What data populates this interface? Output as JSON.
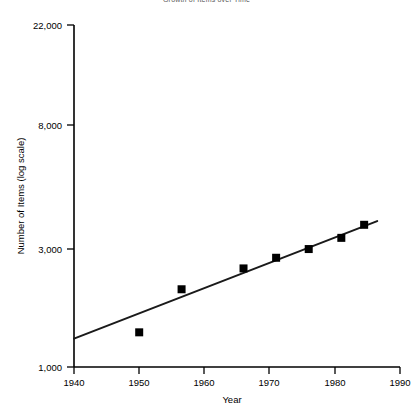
{
  "chart_data": {
    "type": "scatter",
    "title": "Growth of Items over Time",
    "title_truncated": true,
    "xlabel": "Year",
    "ylabel": "Number of Items (log scale)",
    "yscale": "log",
    "xlim": [
      1940,
      1990
    ],
    "ylim": [
      1000,
      22000
    ],
    "grid": false,
    "legend": false,
    "xticks": [
      1940,
      1950,
      1960,
      1970,
      1980,
      1990
    ],
    "xtick_labels": [
      "1940",
      "1950",
      "1960",
      "1970",
      "1980",
      "1990"
    ],
    "yticks": [
      1000,
      3000,
      8000,
      22000
    ],
    "ytick_labels": [
      "1,000",
      "3,000",
      "8,000",
      "22,000"
    ],
    "series": [
      {
        "name": "Number of Items",
        "marker": "square",
        "color": "#000000",
        "x": [
          1950,
          1956.5,
          1966,
          1971,
          1976,
          1981,
          1984.5
        ],
        "y": [
          2050,
          5000,
          7700,
          9600,
          11500,
          14500,
          19000
        ]
      },
      {
        "name": "Fitted trend line",
        "type": "line",
        "color": "#1a1a1a",
        "x": [
          1940,
          1986.5
        ],
        "y": [
          1800,
          20500
        ]
      }
    ]
  },
  "axes": {
    "y_title": "Number of Items (log scale)",
    "x_title": "Year",
    "y_ticks": [
      {
        "label": "22,000",
        "value": 22000
      },
      {
        "label": "8,000",
        "value": 8000
      },
      {
        "label": "3,000",
        "value": 3000
      },
      {
        "label": "1,000",
        "value": 1000
      }
    ],
    "x_ticks": [
      {
        "label": "1940",
        "value": 1940
      },
      {
        "label": "1950",
        "value": 1950
      },
      {
        "label": "1960",
        "value": 1960
      },
      {
        "label": "1970",
        "value": 1970
      },
      {
        "label": "1980",
        "value": 1980
      },
      {
        "label": "1990",
        "value": 1990
      }
    ]
  },
  "header": {
    "title": "Growth of Items over Time"
  }
}
